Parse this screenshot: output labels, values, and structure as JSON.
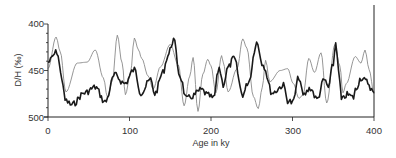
{
  "chart_data": {
    "type": "line",
    "title": "",
    "xlabel": "Age in ky",
    "ylabel": "D/H (‰)",
    "xlim": [
      0,
      400
    ],
    "ylim": [
      500,
      400
    ],
    "y_inverted": true,
    "grid": false,
    "legend": null,
    "x_ticks": [
      0,
      100,
      200,
      300,
      400
    ],
    "x_tick_labels": [
      "0",
      "100",
      "200",
      "300",
      "400"
    ],
    "y_ticks": [
      400,
      450,
      500
    ],
    "y_tick_labels": [
      "400",
      "450",
      "500"
    ],
    "y_minor_step": 10,
    "series": [
      {
        "name": "light curve",
        "color": "#8a8a8a",
        "style": "thin smooth",
        "x": [
          0,
          10,
          15,
          22,
          36,
          48,
          58,
          68,
          73,
          79,
          85,
          91,
          95,
          101,
          106,
          111,
          115,
          123,
          129,
          138,
          150,
          160,
          167,
          174,
          178,
          184,
          190,
          196,
          200,
          206,
          213,
          215,
          221,
          232,
          239,
          244,
          252,
          258,
          263,
          267,
          272,
          285,
          294,
          301,
          308,
          313,
          320,
          327,
          335,
          342,
          352,
          358,
          362,
          366,
          377,
          384,
          389,
          394,
          400
        ],
        "y": [
          448,
          414,
          430,
          473,
          442,
          441,
          428,
          458,
          479,
          461,
          412,
          442,
          476,
          454,
          415,
          428,
          437,
          456,
          470,
          446,
          422,
          444,
          488,
          456,
          436,
          494,
          454,
          438,
          445,
          474,
          434,
          441,
          473,
          448,
          416,
          426,
          478,
          491,
          468,
          439,
          462,
          450,
          448,
          464,
          480,
          476,
          437,
          452,
          431,
          485,
          422,
          445,
          474,
          464,
          435,
          442,
          428,
          449,
          475
        ]
      },
      {
        "name": "dark curve",
        "color": "#1a1a1a",
        "style": "thick noisy",
        "x": [
          0,
          11,
          17,
          21,
          29,
          45,
          58,
          70,
          82,
          94,
          106,
          114,
          126,
          131,
          141,
          147,
          154,
          162,
          170,
          176,
          188,
          197,
          203,
          210,
          215,
          221,
          228,
          239,
          246,
          256,
          264,
          275,
          289,
          294,
          300,
          308,
          313,
          322,
          330,
          339,
          344,
          350,
          353,
          358,
          360,
          367,
          375,
          377,
          384,
          391,
          400
        ],
        "y": [
          441,
          430,
          458,
          482,
          487,
          474,
          468,
          484,
          455,
          464,
          449,
          474,
          460,
          475,
          452,
          434,
          417,
          456,
          481,
          478,
          471,
          477,
          480,
          447,
          465,
          447,
          437,
          476,
          462,
          420,
          444,
          474,
          466,
          482,
          485,
          457,
          477,
          469,
          481,
          460,
          468,
          443,
          420,
          462,
          482,
          476,
          479,
          471,
          458,
          462,
          474
        ]
      }
    ]
  }
}
